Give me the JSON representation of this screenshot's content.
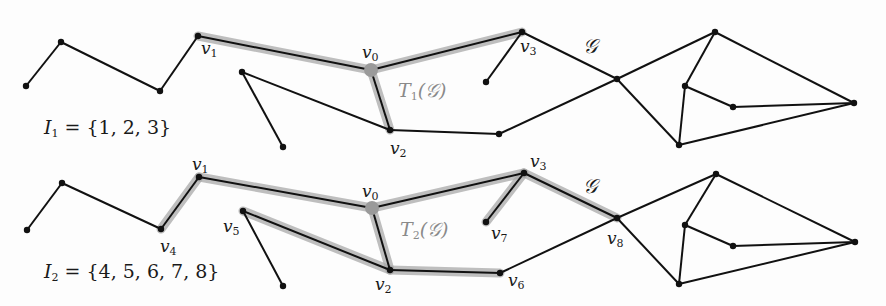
{
  "colors": {
    "edge": "#111111",
    "highlight": "#a8a8a8",
    "root": "#9a9a9a",
    "node": "#111111",
    "tree_label": "#8a8a8a"
  },
  "graph_name": "𝒢",
  "panels": [
    {
      "id": "top",
      "set_label": {
        "name": "I",
        "sub": "1",
        "value": "= {1, 2, 3}"
      },
      "tree_label": {
        "name": "T",
        "sub": "1",
        "arg": "(𝒢)"
      },
      "nodes": {
        "a": [
          26,
          86
        ],
        "b": [
          61,
          42
        ],
        "v1": [
          198,
          36
        ],
        "c": [
          160,
          91
        ],
        "v5": [
          242,
          72
        ],
        "p": [
          283,
          147
        ],
        "v0": [
          371,
          70
        ],
        "v2": [
          390,
          130
        ],
        "v3": [
          522,
          32
        ],
        "v7": [
          486,
          82
        ],
        "v6": [
          499,
          134
        ],
        "v8": [
          617,
          79
        ],
        "r1": [
          715,
          32
        ],
        "r2": [
          685,
          86
        ],
        "r3": [
          733,
          107
        ],
        "r4": [
          854,
          103
        ],
        "r5": [
          679,
          145
        ]
      },
      "highlight_edges": [
        [
          "v1",
          "v0"
        ],
        [
          "v0",
          "v3"
        ],
        [
          "v0",
          "v2"
        ]
      ],
      "edges": [
        [
          "a",
          "b"
        ],
        [
          "b",
          "c"
        ],
        [
          "c",
          "v1"
        ],
        [
          "v1",
          "v0"
        ],
        [
          "v0",
          "v3"
        ],
        [
          "v0",
          "v2"
        ],
        [
          "v5",
          "p"
        ],
        [
          "v5",
          "v2"
        ],
        [
          "v2",
          "v6"
        ],
        [
          "v3",
          "v7"
        ],
        [
          "v3",
          "v8"
        ],
        [
          "v6",
          "v8"
        ],
        [
          "v8",
          "r1"
        ],
        [
          "v8",
          "r5"
        ],
        [
          "r1",
          "r2"
        ],
        [
          "r1",
          "r4"
        ],
        [
          "r2",
          "r3"
        ],
        [
          "r2",
          "r5"
        ],
        [
          "r3",
          "r4"
        ],
        [
          "r5",
          "r4"
        ]
      ],
      "vertex_labels": [
        {
          "name": "v",
          "sub": "1",
          "x": 201,
          "y": 40
        },
        {
          "name": "v",
          "sub": "0",
          "x": 362,
          "y": 44
        },
        {
          "name": "v",
          "sub": "3",
          "x": 520,
          "y": 38
        },
        {
          "name": "v",
          "sub": "2",
          "x": 390,
          "y": 140
        }
      ],
      "graph_label_pos": [
        583,
        36
      ],
      "tree_label_pos": [
        398,
        81
      ],
      "set_label_pos": [
        44,
        118
      ]
    },
    {
      "id": "bottom",
      "set_label": {
        "name": "I",
        "sub": "2",
        "value": "= {4, 5, 6, 7, 8}"
      },
      "tree_label": {
        "name": "T",
        "sub": "2",
        "arg": "(𝒢)"
      },
      "nodes": {
        "a": [
          27,
          230
        ],
        "b": [
          62,
          183
        ],
        "v1": [
          199,
          177
        ],
        "c": [
          161,
          229
        ],
        "v5": [
          243,
          211
        ],
        "p": [
          283,
          286
        ],
        "v0": [
          372,
          208
        ],
        "v2": [
          390,
          270
        ],
        "v3": [
          524,
          173
        ],
        "v7": [
          486,
          222
        ],
        "v6": [
          500,
          273
        ],
        "v8": [
          617,
          218
        ],
        "r1": [
          716,
          174
        ],
        "r2": [
          685,
          225
        ],
        "r3": [
          733,
          246
        ],
        "r4": [
          855,
          242
        ],
        "r5": [
          679,
          284
        ]
      },
      "highlight_edges": [
        [
          "c",
          "v1"
        ],
        [
          "v1",
          "v0"
        ],
        [
          "v0",
          "v3"
        ],
        [
          "v0",
          "v2"
        ],
        [
          "v5",
          "v2"
        ],
        [
          "v2",
          "v6"
        ],
        [
          "v3",
          "v7"
        ],
        [
          "v3",
          "v8"
        ]
      ],
      "edges": [
        [
          "a",
          "b"
        ],
        [
          "b",
          "c"
        ],
        [
          "c",
          "v1"
        ],
        [
          "v1",
          "v0"
        ],
        [
          "v0",
          "v3"
        ],
        [
          "v0",
          "v2"
        ],
        [
          "v5",
          "p"
        ],
        [
          "v5",
          "v2"
        ],
        [
          "v2",
          "v6"
        ],
        [
          "v3",
          "v7"
        ],
        [
          "v3",
          "v8"
        ],
        [
          "v6",
          "v8"
        ],
        [
          "v8",
          "r1"
        ],
        [
          "v8",
          "r5"
        ],
        [
          "r1",
          "r2"
        ],
        [
          "r1",
          "r4"
        ],
        [
          "r2",
          "r3"
        ],
        [
          "r2",
          "r5"
        ],
        [
          "r3",
          "r4"
        ],
        [
          "r5",
          "r4"
        ]
      ],
      "vertex_labels": [
        {
          "name": "v",
          "sub": "1",
          "x": 192,
          "y": 156
        },
        {
          "name": "v",
          "sub": "0",
          "x": 362,
          "y": 183
        },
        {
          "name": "v",
          "sub": "3",
          "x": 530,
          "y": 153
        },
        {
          "name": "v",
          "sub": "4",
          "x": 160,
          "y": 238
        },
        {
          "name": "v",
          "sub": "5",
          "x": 223,
          "y": 218
        },
        {
          "name": "v",
          "sub": "2",
          "x": 375,
          "y": 276
        },
        {
          "name": "v",
          "sub": "6",
          "x": 508,
          "y": 272
        },
        {
          "name": "v",
          "sub": "7",
          "x": 491,
          "y": 225
        },
        {
          "name": "v",
          "sub": "8",
          "x": 607,
          "y": 230
        }
      ],
      "graph_label_pos": [
        583,
        176
      ],
      "tree_label_pos": [
        400,
        220
      ],
      "set_label_pos": [
        44,
        262
      ]
    }
  ]
}
